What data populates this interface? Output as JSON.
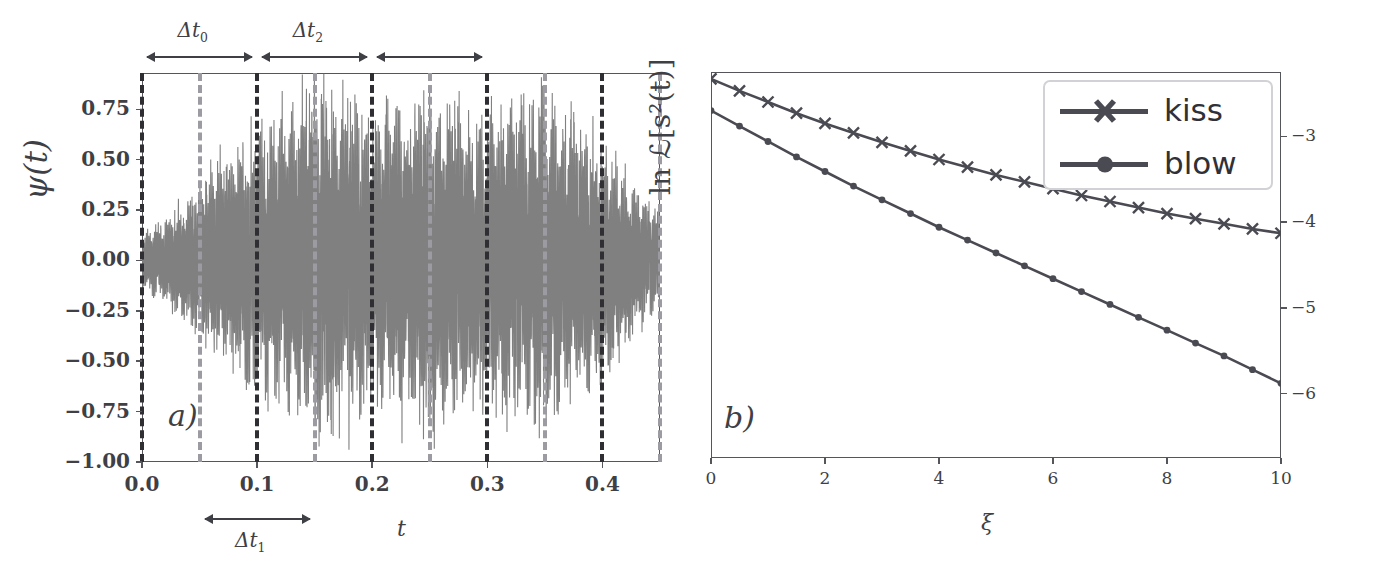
{
  "figure": {
    "background": "#ffffff",
    "ink_color": "#3f3f46",
    "signal_color": "#808080",
    "curve_color": "#4a4a52",
    "dash_dark": "#2f2f33",
    "dash_light": "#9b9ba1"
  },
  "panel_a": {
    "letter": "a)",
    "ylabel": "ψ(t)",
    "xlabel": "t",
    "y_ticks": [
      "0.75",
      "0.50",
      "0.25",
      "0.00",
      "−0.25",
      "−0.50",
      "−0.75",
      "−1.00"
    ],
    "x_ticks": [
      "0.0",
      "0.1",
      "0.2",
      "0.3",
      "0.4"
    ],
    "annotations": [
      {
        "label": "Δt",
        "sub": "0",
        "from_t": 0.0,
        "to_t": 0.1
      },
      {
        "label": "Δt",
        "sub": "2",
        "from_t": 0.1,
        "to_t": 0.2
      },
      {
        "label": "",
        "sub": "",
        "from_t": 0.2,
        "to_t": 0.3
      },
      {
        "label": "Δt",
        "sub": "1",
        "from_t": 0.05,
        "to_t": 0.15
      }
    ],
    "dashed_lines_t": [
      0.0,
      0.05,
      0.1,
      0.15,
      0.2,
      0.25,
      0.3,
      0.35,
      0.4,
      0.45
    ]
  },
  "panel_b": {
    "letter": "b)",
    "ylabel": "ln ℒ[s²(t)]",
    "xlabel": "ξ",
    "y_ticks": [
      "−3",
      "−4",
      "−5",
      "−6"
    ],
    "x_ticks": [
      "0",
      "2",
      "4",
      "6",
      "8",
      "10"
    ],
    "legend": [
      {
        "label": "kiss",
        "marker": "x-marker"
      },
      {
        "label": "blow",
        "marker": "dot-marker"
      }
    ]
  },
  "chart_data": [
    {
      "type": "line",
      "title": "",
      "xlabel": "t",
      "ylabel": "ψ(t)",
      "xlim": [
        0.0,
        0.45
      ],
      "ylim": [
        -1.0,
        0.93
      ],
      "grid": false,
      "legend_position": "none",
      "series": [
        {
          "name": "ψ(t)",
          "description": "dense oscillatory noise signal, amplitude envelope grows from ~0.15 near t=0 to ~0.9 around t=0.15-0.30 then decays to ~0.25 by t=0.45",
          "envelope_t": [
            0.0,
            0.02,
            0.04,
            0.05,
            0.07,
            0.1,
            0.12,
            0.15,
            0.175,
            0.2,
            0.225,
            0.25,
            0.275,
            0.3,
            0.325,
            0.35,
            0.375,
            0.4,
            0.42,
            0.45
          ],
          "envelope_amplitude": [
            0.12,
            0.22,
            0.33,
            0.38,
            0.52,
            0.66,
            0.74,
            0.89,
            0.86,
            0.74,
            0.8,
            0.88,
            0.78,
            0.73,
            0.8,
            0.86,
            0.72,
            0.62,
            0.42,
            0.24
          ]
        }
      ],
      "annotations": [
        {
          "text": "Δt₀",
          "span_x": [
            0.0,
            0.1
          ],
          "position": "above-axes"
        },
        {
          "text": "Δt₂",
          "span_x": [
            0.1,
            0.2
          ],
          "position": "above-axes"
        },
        {
          "text": "",
          "span_x": [
            0.2,
            0.3
          ],
          "position": "above-axes"
        },
        {
          "text": "Δt₁",
          "span_x": [
            0.05,
            0.15
          ],
          "position": "below-axes"
        }
      ],
      "vertical_dashed_lines": [
        0.0,
        0.05,
        0.1,
        0.15,
        0.2,
        0.25,
        0.3,
        0.35,
        0.4,
        0.45
      ]
    },
    {
      "type": "line",
      "title": "",
      "xlabel": "ξ",
      "ylabel": "ln ℒ[s²(t)]",
      "xlim": [
        0,
        10
      ],
      "ylim": [
        -6.75,
        -2.25
      ],
      "grid": false,
      "legend_position": "upper right",
      "x": [
        0,
        0.5,
        1,
        1.5,
        2,
        2.5,
        3,
        3.5,
        4,
        4.5,
        5,
        5.5,
        6,
        6.5,
        7,
        7.5,
        8,
        8.5,
        9,
        9.5,
        10
      ],
      "series": [
        {
          "name": "kiss",
          "marker": "x",
          "values": [
            -2.33,
            -2.47,
            -2.6,
            -2.73,
            -2.85,
            -2.96,
            -3.07,
            -3.17,
            -3.27,
            -3.36,
            -3.45,
            -3.53,
            -3.61,
            -3.69,
            -3.76,
            -3.83,
            -3.9,
            -3.96,
            -4.02,
            -4.08,
            -4.13
          ]
        },
        {
          "name": "blow",
          "marker": "o",
          "values": [
            -2.7,
            -2.88,
            -3.06,
            -3.24,
            -3.41,
            -3.58,
            -3.74,
            -3.9,
            -4.06,
            -4.21,
            -4.36,
            -4.51,
            -4.66,
            -4.81,
            -4.96,
            -5.11,
            -5.26,
            -5.41,
            -5.56,
            -5.72,
            -5.88
          ]
        }
      ]
    }
  ]
}
